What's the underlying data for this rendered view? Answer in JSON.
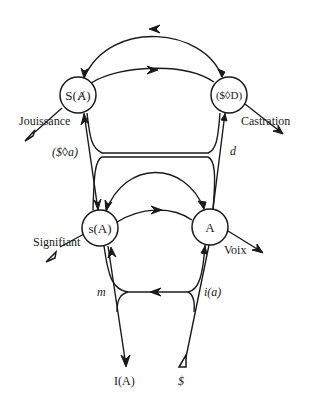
{
  "diagram": {
    "title": "",
    "nodes": {
      "s_barred_a": {
        "label": "S(Ⱥ)"
      },
      "drive": {
        "label": "($◊D)"
      },
      "signified": {
        "label": "s(A)"
      },
      "other": {
        "label": "A"
      }
    },
    "labels": {
      "jouissance": "Jouissance",
      "castration": "Castration",
      "fantasy": "($◊a)",
      "desire": "d",
      "signifiant": "Signifiant",
      "voix": "Voix",
      "ego": "m",
      "ego_image": "i(a)",
      "ego_ideal": "I(A)",
      "barred_subject": "$"
    },
    "edges": [
      {
        "from": "drive",
        "to": "s_barred_a",
        "direction": "left",
        "shape": "upper arc"
      },
      {
        "from": "s_barred_a",
        "to": "drive",
        "direction": "right",
        "shape": "middle arc"
      },
      {
        "from": "other",
        "to": "signified",
        "direction": "left",
        "shape": "lower arc"
      },
      {
        "from": "signified",
        "to": "other",
        "direction": "right",
        "shape": "arc"
      },
      {
        "from": "i(a)",
        "to": "m",
        "direction": "left",
        "shape": "horizontal"
      },
      {
        "from": "$",
        "to": "I(A)",
        "direction": "up then down",
        "shape": "retroversion vector"
      }
    ],
    "colors": {
      "ink": "#1a1a1a",
      "background": "#ffffff"
    }
  }
}
